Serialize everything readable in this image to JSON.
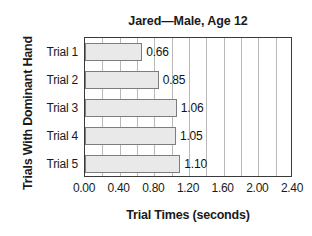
{
  "chart_data": {
    "type": "bar",
    "orientation": "horizontal",
    "title": "Jared—Male, Age 12",
    "xlabel": "Trial Times (seconds)",
    "ylabel": "Trials With Dominant Hand",
    "categories": [
      "Trial 1",
      "Trial 2",
      "Trial 3",
      "Trial 4",
      "Trial 5"
    ],
    "values": [
      0.66,
      0.85,
      1.06,
      1.05,
      1.1
    ],
    "value_labels": [
      "0.66",
      "0.85",
      "1.06",
      "1.05",
      "1.10"
    ],
    "xlim": [
      0.0,
      2.4
    ],
    "xticks": [
      0.0,
      0.4,
      0.8,
      1.2,
      1.6,
      2.0,
      2.4
    ],
    "xtick_labels": [
      "0.00",
      "0.40",
      "0.80",
      "1.20",
      "1.60",
      "2.00",
      "2.40"
    ],
    "gridline_interval": 0.2,
    "grid": true,
    "legend": "none",
    "colors": {
      "bar_fill": "#e9e9e9",
      "bar_border": "#7d7d7d",
      "gridline": "#b9b9b9",
      "axis_frame": "#3a3a3a",
      "text": "#1a1a1a",
      "background": "#ffffff"
    }
  }
}
